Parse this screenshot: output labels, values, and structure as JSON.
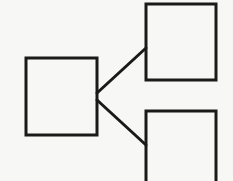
{
  "diagram": {
    "type": "tree",
    "background": "#f7f7f5",
    "stroke": "#1a1a1a",
    "stroke_width": 3,
    "nodes": [
      {
        "id": "root",
        "x": 26,
        "y": 58,
        "w": 71,
        "h": 77
      },
      {
        "id": "child-top",
        "x": 146,
        "y": 4,
        "w": 70,
        "h": 76
      },
      {
        "id": "child-bottom",
        "x": 146,
        "y": 111,
        "w": 70,
        "h": 80
      }
    ],
    "edges": [
      {
        "from": "root",
        "to": "child-top",
        "x1": 97,
        "y1": 93,
        "x2": 146,
        "y2": 48
      },
      {
        "from": "root",
        "to": "child-bottom",
        "x1": 97,
        "y1": 100,
        "x2": 146,
        "y2": 145
      }
    ]
  }
}
